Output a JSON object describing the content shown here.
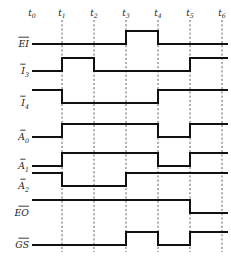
{
  "figure": {
    "kind": "digital-timing-diagram",
    "background_color": "#ffffff",
    "line_color": "#111111",
    "gridline_color": "#3a3a3a"
  },
  "time_axis": {
    "labels": [
      "t",
      "t",
      "t",
      "t",
      "t",
      "t",
      "t"
    ],
    "subscripts": [
      "0",
      "1",
      "2",
      "3",
      "4",
      "5",
      "6"
    ],
    "full_labels": [
      "t0",
      "t1",
      "t2",
      "t3",
      "t4",
      "t5",
      "t6"
    ],
    "x_positions": [
      32,
      62,
      94,
      126,
      158,
      190,
      222
    ],
    "gridline_indices": [
      1,
      2,
      3,
      4,
      5,
      6
    ]
  },
  "signals": [
    {
      "name": "EI",
      "base": "EI",
      "subscript": "",
      "overbar": true,
      "baseline_y": 44,
      "high_y": 31,
      "transitions": [
        {
          "x": 32,
          "level": 0
        },
        {
          "x": 126,
          "level": 1
        },
        {
          "x": 158,
          "level": 0
        },
        {
          "x": 228,
          "level": 0
        }
      ]
    },
    {
      "name": "I3",
      "base": "I",
      "subscript": "3",
      "overbar": true,
      "baseline_y": 71,
      "high_y": 58,
      "transitions": [
        {
          "x": 32,
          "level": 0
        },
        {
          "x": 62,
          "level": 1
        },
        {
          "x": 94,
          "level": 0
        },
        {
          "x": 190,
          "level": 1
        },
        {
          "x": 228,
          "level": 1
        }
      ]
    },
    {
      "name": "I4",
      "base": "I",
      "subscript": "4",
      "overbar": true,
      "baseline_y": 103,
      "high_y": 90,
      "transitions": [
        {
          "x": 32,
          "level": 1
        },
        {
          "x": 62,
          "level": 0
        },
        {
          "x": 158,
          "level": 1
        },
        {
          "x": 228,
          "level": 1
        }
      ]
    },
    {
      "name": "A0",
      "base": "A",
      "subscript": "0",
      "overbar": true,
      "baseline_y": 137,
      "high_y": 124,
      "transitions": [
        {
          "x": 32,
          "level": 0
        },
        {
          "x": 62,
          "level": 1
        },
        {
          "x": 158,
          "level": 0
        },
        {
          "x": 190,
          "level": 1
        },
        {
          "x": 228,
          "level": 1
        }
      ]
    },
    {
      "name": "A1",
      "base": "A",
      "subscript": "1",
      "overbar": true,
      "baseline_y": 166,
      "high_y": 153,
      "transitions": [
        {
          "x": 32,
          "level": 0
        },
        {
          "x": 62,
          "level": 1
        },
        {
          "x": 158,
          "level": 0
        },
        {
          "x": 190,
          "level": 1
        },
        {
          "x": 228,
          "level": 1
        }
      ]
    },
    {
      "name": "A2",
      "base": "A",
      "subscript": "2",
      "overbar": true,
      "baseline_y": 186,
      "high_y": 173,
      "transitions": [
        {
          "x": 32,
          "level": 1
        },
        {
          "x": 62,
          "level": 0
        },
        {
          "x": 126,
          "level": 1
        },
        {
          "x": 228,
          "level": 1
        }
      ]
    },
    {
      "name": "EO",
      "base": "EO",
      "subscript": "",
      "overbar": true,
      "baseline_y": 213,
      "high_y": 200,
      "transitions": [
        {
          "x": 32,
          "level": 1
        },
        {
          "x": 190,
          "level": 0
        },
        {
          "x": 228,
          "level": 0
        }
      ]
    },
    {
      "name": "GS",
      "base": "GS",
      "subscript": "",
      "overbar": true,
      "baseline_y": 245,
      "high_y": 232,
      "transitions": [
        {
          "x": 32,
          "level": 0
        },
        {
          "x": 126,
          "level": 1
        },
        {
          "x": 158,
          "level": 0
        },
        {
          "x": 190,
          "level": 1
        },
        {
          "x": 228,
          "level": 1
        }
      ]
    }
  ],
  "geometry": {
    "wave_start_x": 32,
    "wave_end_x": 228,
    "grid_top_y": 20,
    "grid_bottom_y": 252,
    "label_right_x": 29
  }
}
